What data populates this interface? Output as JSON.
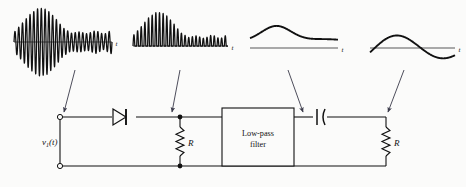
{
  "figure": {
    "kind": "am-envelope-detector-circuit",
    "background_color": "#fbfbfa",
    "ink_color": "#111111",
    "arrow_color": "#3a3a4a"
  },
  "waveforms": [
    {
      "id": "wf-modulated-input",
      "name": "amplitude-modulated-input",
      "axis_label": "t",
      "description": "bipolar AM carrier with rising then falling envelope",
      "bipolar": true,
      "axis": {
        "x0": 14,
        "x1": 112,
        "y": 42
      },
      "carrier_cycles": 26,
      "envelope": [
        0.28,
        0.55,
        0.82,
        1.0,
        0.96,
        0.72,
        0.42,
        0.26,
        0.3,
        0.24,
        0.34,
        0.22,
        0.36
      ],
      "peak_amplitude_px": 34
    },
    {
      "id": "wf-rectified",
      "name": "half-wave-rectified-signal",
      "axis_label": "t",
      "description": "positive-only humps after diode rectification",
      "bipolar": false,
      "axis": {
        "x0": 133,
        "x1": 228,
        "y": 46
      },
      "carrier_cycles": 26,
      "envelope": [
        0.3,
        0.56,
        0.84,
        1.0,
        0.95,
        0.7,
        0.4,
        0.25,
        0.3,
        0.22,
        0.33,
        0.21,
        0.35
      ],
      "peak_amplitude_px": 34
    },
    {
      "id": "wf-envelope-dc",
      "name": "filtered-envelope-with-dc-offset",
      "axis_label": "t",
      "description": "smooth envelope curve entirely above the time axis",
      "bipolar": false,
      "axis": {
        "x0": 250,
        "x1": 338,
        "y": 48
      },
      "peak_amplitude_px": 22
    },
    {
      "id": "wf-ac-coupled",
      "name": "ac-coupled-output",
      "axis_label": "t",
      "description": "demodulated output swinging above and below the axis",
      "bipolar": true,
      "axis": {
        "x0": 370,
        "x1": 455,
        "y": 48
      },
      "peak_amplitude_px": 14
    }
  ],
  "circuit": {
    "top_rail_y": 117,
    "bottom_rail_y": 166,
    "source": {
      "label": "v",
      "label_sub": "1",
      "label_tail": "(t)",
      "name": "input-voltage-source",
      "terminal_x": 60
    },
    "diode": {
      "name": "diode",
      "label": "",
      "x": 124,
      "direction": "right"
    },
    "resistor_left": {
      "name": "load-resistor-left",
      "label": "R",
      "x": 180
    },
    "filter_block": {
      "name": "low-pass-filter-block",
      "line1": "Low-pass",
      "line2": "filter",
      "x": 222,
      "y": 108,
      "w": 72,
      "h": 58
    },
    "capacitor": {
      "name": "coupling-capacitor",
      "label": "",
      "x": 320
    },
    "resistor_right": {
      "name": "load-resistor-right",
      "label": "R",
      "x": 386
    }
  },
  "arrows": [
    {
      "name": "arrow-to-input-terminal",
      "from_waveform": "wf-modulated-input",
      "x1": 75,
      "y1": 70,
      "x2": 64,
      "y2": 112
    },
    {
      "name": "arrow-to-rectified-node",
      "from_waveform": "wf-rectified",
      "x1": 180,
      "y1": 70,
      "x2": 172,
      "y2": 112
    },
    {
      "name": "arrow-to-filter-output",
      "from_waveform": "wf-envelope-dc",
      "x1": 288,
      "y1": 70,
      "x2": 303,
      "y2": 112
    },
    {
      "name": "arrow-to-output-node",
      "from_waveform": "wf-ac-coupled",
      "x1": 404,
      "y1": 70,
      "x2": 388,
      "y2": 112
    }
  ]
}
